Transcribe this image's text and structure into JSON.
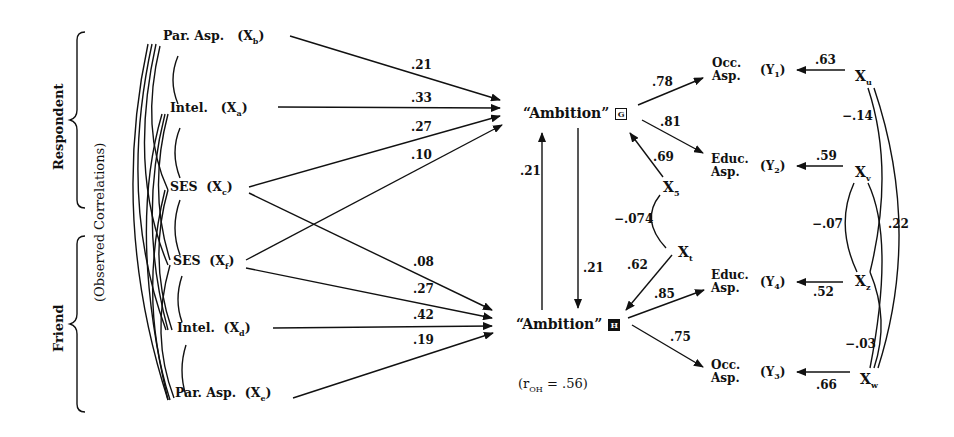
{
  "groups": {
    "respondent": "Respondent",
    "friend": "Friend",
    "observed": "(Observed Correlations)"
  },
  "exogenous": [
    {
      "name": "Par. Asp.",
      "var": "X",
      "sub": "b",
      "group": "respondent"
    },
    {
      "name": "Intel.",
      "var": "X",
      "sub": "a",
      "group": "respondent"
    },
    {
      "name": "SES",
      "var": "X",
      "sub": "c",
      "group": "respondent"
    },
    {
      "name": "SES",
      "var": "X",
      "sub": "f",
      "group": "friend"
    },
    {
      "name": "Intel.",
      "var": "X",
      "sub": "d",
      "group": "friend"
    },
    {
      "name": "Par. Asp.",
      "var": "X",
      "sub": "e",
      "group": "friend"
    }
  ],
  "latent": {
    "g": {
      "label": "“Ambition”",
      "box": "G"
    },
    "h": {
      "label": "“Ambition”",
      "box": "H"
    },
    "r_oh": "(r",
    "r_sub": "OH",
    "r_val": " = .56)"
  },
  "paths_to_g": [
    ".21",
    ".33",
    ".27",
    ".10"
  ],
  "paths_to_h": [
    ".08",
    ".27",
    ".42",
    ".19"
  ],
  "reciprocal": {
    "h_to_g": ".21",
    "g_to_h": ".21"
  },
  "residual_latent": {
    "x5": {
      "var": "X",
      "sub": "5",
      "to_g": ".69"
    },
    "x1": {
      "var": "X",
      "sub": "t",
      "to_h": ".62"
    },
    "corr": "−.074"
  },
  "indicators": [
    {
      "name1": "Occ.",
      "name2": "Asp.",
      "y": "(Y",
      "ysub": "1",
      "loading": ".78",
      "err": ".63",
      "xvar": "X",
      "xsub": "u"
    },
    {
      "name1": "Educ.",
      "name2": "Asp.",
      "y": "(Y",
      "ysub": "2",
      "loading": ".81",
      "err": ".59",
      "xvar": "X",
      "xsub": "v"
    },
    {
      "name1": "Educ.",
      "name2": "Asp.",
      "y": "(Y",
      "ysub": "4",
      "loading": ".85",
      "err": ".52",
      "xvar": "X",
      "xsub": "z"
    },
    {
      "name1": "Occ.",
      "name2": "Asp.",
      "y": "(Y",
      "ysub": "3",
      "loading": ".75",
      "err": ".66",
      "xvar": "X",
      "xsub": "w"
    }
  ],
  "error_correlations": {
    "uv": "−.14",
    "vz": "−.07",
    "uz": ".22",
    "zw": "−.03"
  },
  "close_paren": ")"
}
